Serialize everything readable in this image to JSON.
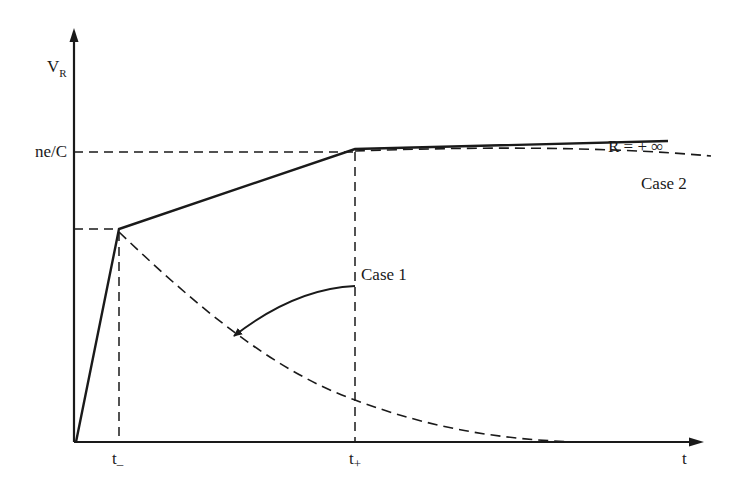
{
  "diagram": {
    "type": "voltage-time plot",
    "colors": {
      "line": "#1a1a1a",
      "background": "#ffffff"
    },
    "axes": {
      "y_label_main": "V",
      "y_label_sub": "R",
      "x_label": "t"
    },
    "y_ticks": {
      "ne_over_c": "ne/C"
    },
    "x_ticks": {
      "t_minus_main": "t",
      "t_minus_sub": "–",
      "t_plus_main": "t",
      "t_plus_sub": "+"
    },
    "annotations": {
      "r_infinity": "R = + ∞",
      "case1": "Case 1",
      "case2": "Case 2"
    },
    "curves": [
      {
        "name": "R = +∞",
        "style": "solid",
        "points": [
          [
            0,
            0
          ],
          [
            "t_-",
            "V1"
          ],
          [
            "t_+",
            "ne/C"
          ],
          [
            "end",
            "slightly above ne/C"
          ]
        ]
      },
      {
        "name": "Case 1",
        "style": "dashed",
        "description": "exponential decay from peak at t_- toward 0"
      },
      {
        "name": "Case 2",
        "style": "dashed",
        "description": "follows solid to t_+, then slowly decays below ne/C"
      }
    ]
  }
}
